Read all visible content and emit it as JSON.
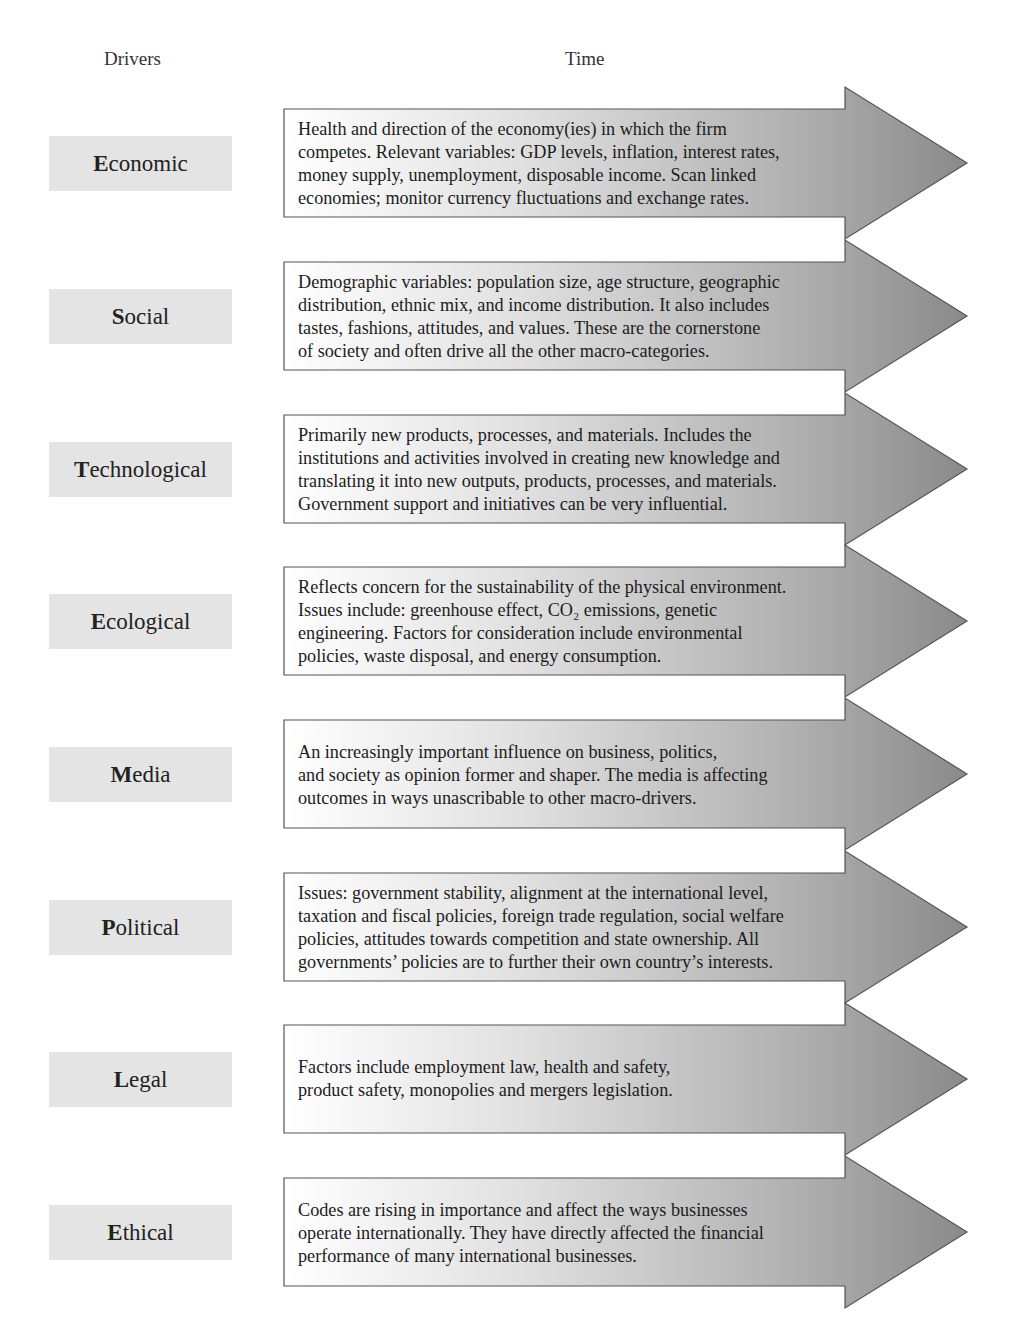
{
  "headers": {
    "drivers": "Drivers",
    "time": "Time"
  },
  "colors": {
    "label_bg": "#e4e4e4",
    "arrow_light": "#ffffff",
    "arrow_dark": "#8a8a8a",
    "arrow_border": "#555555"
  },
  "drivers": [
    {
      "initial": "E",
      "rest": "conomic",
      "label": "Economic",
      "description": "Health and direction of the economy(ies) in which the firm\ncompetes. Relevant variables: GDP levels, inflation, interest rates,\nmoney supply, unemployment, disposable income. Scan linked\neconomies; monitor currency fluctuations and exchange rates."
    },
    {
      "initial": "S",
      "rest": "ocial",
      "label": "Social",
      "description": "Demographic variables: population size, age structure, geographic\ndistribution, ethnic mix, and income distribution. It also includes\ntastes, fashions, attitudes, and values. These are the cornerstone\nof society and often drive all the other macro-categories."
    },
    {
      "initial": "T",
      "rest": "echnological",
      "label": "Technological",
      "description": "Primarily new products, processes, and materials. Includes the\ninstitutions and activities involved in creating new knowledge and\ntranslating it into new outputs, products, processes, and materials.\nGovernment support and initiatives can be very influential."
    },
    {
      "initial": "E",
      "rest": "cological",
      "label": "Ecological",
      "description": "Reflects concern for the sustainability of the physical environment.\nIssues include: greenhouse effect, CO₂ emissions, genetic\nengineering. Factors for consideration include environmental\npolicies, waste disposal, and energy consumption."
    },
    {
      "initial": "M",
      "rest": "edia",
      "label": "Media",
      "description": "An increasingly important influence on business, politics,\nand society as opinion former and shaper. The media is affecting\noutcomes in ways unascribable to other macro-drivers."
    },
    {
      "initial": "P",
      "rest": "olitical",
      "label": "Political",
      "description": "Issues: government stability, alignment at the international level,\ntaxation and fiscal policies, foreign trade regulation, social welfare\npolicies, attitudes towards competition and state ownership. All\ngovernments’ policies are to further their own country’s interests."
    },
    {
      "initial": "L",
      "rest": "egal",
      "label": "Legal",
      "description": "Factors include employment law, health and safety,\nproduct safety, monopolies and mergers legislation."
    },
    {
      "initial": "E",
      "rest": "thical",
      "label": "Ethical",
      "description": "Codes are rising in importance and affect the ways businesses\noperate internationally. They have directly affected the financial\nperformance of many international businesses."
    }
  ]
}
